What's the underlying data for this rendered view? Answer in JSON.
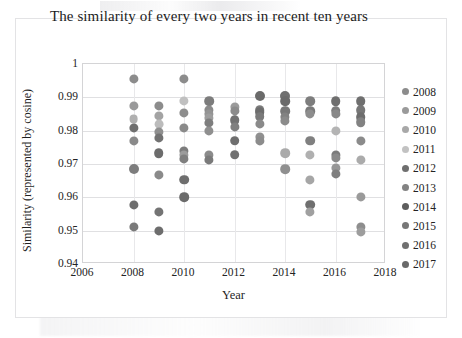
{
  "chart_data": {
    "type": "scatter",
    "title": "The similarity of every two years in recent ten years",
    "xlabel": "Year",
    "ylabel": "Similarity (represented by cosine)",
    "xlim": [
      2006,
      2018
    ],
    "ylim": [
      0.94,
      1
    ],
    "xticks": [
      "2006",
      "2008",
      "2010",
      "2012",
      "2014",
      "2016",
      "2018"
    ],
    "yticks": [
      "0.94",
      "0.95",
      "0.96",
      "0.97",
      "0.98",
      "0.99",
      "1"
    ],
    "grid": "horizontal-and-vertical",
    "legend_position": "right",
    "series": [
      {
        "name": "2008",
        "color": "#8c8c8c",
        "x": [
          2008,
          2009,
          2010,
          2011,
          2012,
          2013,
          2014,
          2015,
          2016,
          2017
        ],
        "values": [
          0.9955,
          0.9875,
          0.9955,
          0.9888,
          0.987,
          0.9903,
          0.9905,
          0.9888,
          0.9888,
          0.9888
        ]
      },
      {
        "name": "2009",
        "color": "#9a9a9a",
        "x": [
          2008,
          2009,
          2010,
          2011,
          2012,
          2013,
          2014,
          2015,
          2016,
          2017
        ],
        "values": [
          0.9875,
          0.9845,
          0.9888,
          0.986,
          0.9858,
          0.9862,
          0.9888,
          0.9858,
          0.9858,
          0.9862
        ]
      },
      {
        "name": "2010",
        "color": "#a8a8a8",
        "x": [
          2008,
          2009,
          2010,
          2011,
          2012,
          2013,
          2014,
          2015,
          2016,
          2017
        ],
        "values": [
          0.9835,
          0.982,
          0.9852,
          0.985,
          0.9832,
          0.9855,
          0.9858,
          0.985,
          0.985,
          0.9838
        ]
      },
      {
        "name": "2011",
        "color": "#c2c2c2",
        "x": [
          2008,
          2009,
          2010,
          2011,
          2012,
          2013,
          2014,
          2015,
          2016,
          2017
        ],
        "values": [
          0.9808,
          0.979,
          0.9808,
          0.9838,
          0.981,
          0.984,
          0.984,
          0.977,
          0.98,
          0.9825
        ]
      },
      {
        "name": "2012",
        "color": "#6f6f6f",
        "x": [
          2008,
          2009,
          2010,
          2011,
          2012,
          2013,
          2014,
          2015,
          2016,
          2017
        ],
        "values": [
          0.977,
          0.9775,
          0.9738,
          0.9825,
          0.977,
          0.982,
          0.9832,
          0.9728,
          0.9728,
          0.977
        ]
      },
      {
        "name": "2013",
        "color": "#838383",
        "x": [
          2008,
          2009,
          2010,
          2011,
          2012,
          2013,
          2014,
          2015,
          2016,
          2017
        ],
        "values": [
          0.9685,
          0.9732,
          0.9727,
          0.98,
          0.9728,
          0.9782,
          0.9733,
          0.9653,
          0.972,
          0.9712
        ]
      },
      {
        "name": "2014",
        "color": "#5e5e5e",
        "x": [
          2008,
          2009,
          2010,
          2011,
          2012,
          2013,
          2014,
          2015,
          2016,
          2017
        ],
        "values": [
          0.9578,
          0.9668,
          0.9718,
          0.9728,
          0.981,
          0.9768,
          0.9685,
          0.9578,
          0.9688,
          0.96
        ]
      },
      {
        "name": "2015",
        "color": "#777777",
        "x": [
          2008,
          2009,
          2010,
          2011,
          2012,
          2013,
          2014,
          2015,
          2016,
          2017
        ],
        "values": [
          0.9512,
          0.9555,
          0.9653,
          0.9712,
          0.9858,
          0.982,
          0.9858,
          0.9555,
          0.967,
          0.9512
        ]
      },
      {
        "name": "2016",
        "color": "#707070",
        "x": [
          2009,
          2010,
          2011,
          2012,
          2013,
          2014,
          2015,
          2016,
          2017
        ],
        "values": [
          0.9498,
          0.96,
          0.9728,
          0.9832,
          0.984,
          0.9832,
          0.985,
          0.9688,
          0.9495
        ]
      },
      {
        "name": "2017",
        "color": "#6a6a6a",
        "x": [
          2010,
          2011,
          2012,
          2013,
          2014,
          2015,
          2016,
          2017
        ],
        "values": [
          0.9727,
          0.985,
          0.9858,
          0.9855,
          0.9905,
          0.9888,
          0.9858,
          0.9825
        ]
      }
    ]
  },
  "legend": {
    "items": [
      {
        "label": "2008",
        "color": "#8c8c8c"
      },
      {
        "label": "2009",
        "color": "#9a9a9a"
      },
      {
        "label": "2010",
        "color": "#a8a8a8"
      },
      {
        "label": "2011",
        "color": "#c2c2c2"
      },
      {
        "label": "2012",
        "color": "#6f6f6f"
      },
      {
        "label": "2013",
        "color": "#838383"
      },
      {
        "label": "2014",
        "color": "#5e5e5e"
      },
      {
        "label": "2015",
        "color": "#777777"
      },
      {
        "label": "2016",
        "color": "#707070"
      },
      {
        "label": "2017",
        "color": "#6a6a6a"
      }
    ]
  },
  "points": [
    {
      "x": 2008,
      "y": 0.9955,
      "c": "#8c8c8c",
      "r": 4.6
    },
    {
      "x": 2008,
      "y": 0.9875,
      "c": "#9a9a9a",
      "r": 4.6
    },
    {
      "x": 2008,
      "y": 0.9835,
      "c": "#b0b0b0",
      "r": 4.4
    },
    {
      "x": 2008,
      "y": 0.9808,
      "c": "#6f6f6f",
      "r": 4.6
    },
    {
      "x": 2008,
      "y": 0.977,
      "c": "#8a8a8a",
      "r": 4.6
    },
    {
      "x": 2008,
      "y": 0.9685,
      "c": "#7d7d7d",
      "r": 5.0
    },
    {
      "x": 2008,
      "y": 0.9578,
      "c": "#6e6e6e",
      "r": 4.6
    },
    {
      "x": 2008,
      "y": 0.9512,
      "c": "#7a7a7a",
      "r": 4.6
    },
    {
      "x": 2009,
      "y": 0.9875,
      "c": "#8c8c8c",
      "r": 4.6
    },
    {
      "x": 2009,
      "y": 0.9845,
      "c": "#a3a3a3",
      "r": 4.6
    },
    {
      "x": 2009,
      "y": 0.982,
      "c": "#bcbcbc",
      "r": 4.4
    },
    {
      "x": 2009,
      "y": 0.9795,
      "c": "#8f8f8f",
      "r": 4.6
    },
    {
      "x": 2009,
      "y": 0.9778,
      "c": "#727272",
      "r": 4.6
    },
    {
      "x": 2009,
      "y": 0.9732,
      "c": "#6c6c6c",
      "r": 4.8
    },
    {
      "x": 2009,
      "y": 0.9668,
      "c": "#8a8a8a",
      "r": 4.6
    },
    {
      "x": 2009,
      "y": 0.9555,
      "c": "#747474",
      "r": 4.6
    },
    {
      "x": 2009,
      "y": 0.9498,
      "c": "#6d6d6d",
      "r": 4.6
    },
    {
      "x": 2010,
      "y": 0.9955,
      "c": "#8c8c8c",
      "r": 4.6
    },
    {
      "x": 2010,
      "y": 0.9888,
      "c": "#c0c0c0",
      "r": 4.6
    },
    {
      "x": 2010,
      "y": 0.9852,
      "c": "#8d8d8d",
      "r": 4.6
    },
    {
      "x": 2010,
      "y": 0.9808,
      "c": "#8a8a8a",
      "r": 4.6
    },
    {
      "x": 2010,
      "y": 0.974,
      "c": "#7c7c7c",
      "r": 4.6
    },
    {
      "x": 2010,
      "y": 0.9728,
      "c": "#9c9c9c",
      "r": 4.6
    },
    {
      "x": 2010,
      "y": 0.9716,
      "c": "#7f7f7f",
      "r": 4.6
    },
    {
      "x": 2010,
      "y": 0.9653,
      "c": "#6e6e6e",
      "r": 4.8
    },
    {
      "x": 2010,
      "y": 0.96,
      "c": "#6b6b6b",
      "r": 4.8
    },
    {
      "x": 2011,
      "y": 0.9888,
      "c": "#7c7c7c",
      "r": 4.8
    },
    {
      "x": 2011,
      "y": 0.9862,
      "c": "#8a8a8a",
      "r": 4.6
    },
    {
      "x": 2011,
      "y": 0.985,
      "c": "#949494",
      "r": 4.6
    },
    {
      "x": 2011,
      "y": 0.9838,
      "c": "#9d9d9d",
      "r": 4.6
    },
    {
      "x": 2011,
      "y": 0.9824,
      "c": "#7e7e7e",
      "r": 4.6
    },
    {
      "x": 2011,
      "y": 0.98,
      "c": "#8f8f8f",
      "r": 4.6
    },
    {
      "x": 2011,
      "y": 0.9728,
      "c": "#8b8b8b",
      "r": 4.6
    },
    {
      "x": 2011,
      "y": 0.9712,
      "c": "#7a7a7a",
      "r": 4.6
    },
    {
      "x": 2012,
      "y": 0.987,
      "c": "#9b9b9b",
      "r": 4.6
    },
    {
      "x": 2012,
      "y": 0.9858,
      "c": "#8b8b8b",
      "r": 4.6
    },
    {
      "x": 2012,
      "y": 0.9832,
      "c": "#717171",
      "r": 4.8
    },
    {
      "x": 2012,
      "y": 0.981,
      "c": "#7f7f7f",
      "r": 4.6
    },
    {
      "x": 2012,
      "y": 0.977,
      "c": "#6e6e6e",
      "r": 4.8
    },
    {
      "x": 2012,
      "y": 0.9728,
      "c": "#717171",
      "r": 4.8
    },
    {
      "x": 2013,
      "y": 0.9903,
      "c": "#6a6a6a",
      "r": 5.0
    },
    {
      "x": 2013,
      "y": 0.9862,
      "c": "#7b7b7b",
      "r": 4.8
    },
    {
      "x": 2013,
      "y": 0.9855,
      "c": "#6d6d6d",
      "r": 4.8
    },
    {
      "x": 2013,
      "y": 0.9842,
      "c": "#7a7a7a",
      "r": 4.8
    },
    {
      "x": 2013,
      "y": 0.982,
      "c": "#8a8a8a",
      "r": 4.6
    },
    {
      "x": 2013,
      "y": 0.9782,
      "c": "#909090",
      "r": 4.6
    },
    {
      "x": 2013,
      "y": 0.9768,
      "c": "#8c8c8c",
      "r": 4.6
    },
    {
      "x": 2014,
      "y": 0.9905,
      "c": "#6f6f6f",
      "r": 5.0
    },
    {
      "x": 2014,
      "y": 0.9888,
      "c": "#6a6a6a",
      "r": 4.8
    },
    {
      "x": 2014,
      "y": 0.9858,
      "c": "#787878",
      "r": 4.8
    },
    {
      "x": 2014,
      "y": 0.9842,
      "c": "#828282",
      "r": 4.6
    },
    {
      "x": 2014,
      "y": 0.983,
      "c": "#8b8b8b",
      "r": 4.6
    },
    {
      "x": 2014,
      "y": 0.9733,
      "c": "#aaaaaa",
      "r": 4.8
    },
    {
      "x": 2014,
      "y": 0.9685,
      "c": "#8f8f8f",
      "r": 4.8
    },
    {
      "x": 2015,
      "y": 0.9888,
      "c": "#7d7d7d",
      "r": 4.8
    },
    {
      "x": 2015,
      "y": 0.9858,
      "c": "#7a7a7a",
      "r": 4.8
    },
    {
      "x": 2015,
      "y": 0.985,
      "c": "#8d8d8d",
      "r": 4.6
    },
    {
      "x": 2015,
      "y": 0.977,
      "c": "#808080",
      "r": 4.8
    },
    {
      "x": 2015,
      "y": 0.9728,
      "c": "#b0b0b0",
      "r": 4.6
    },
    {
      "x": 2015,
      "y": 0.9653,
      "c": "#a6a6a6",
      "r": 4.6
    },
    {
      "x": 2015,
      "y": 0.9578,
      "c": "#6f6f6f",
      "r": 4.8
    },
    {
      "x": 2015,
      "y": 0.9555,
      "c": "#a0a0a0",
      "r": 4.6
    },
    {
      "x": 2016,
      "y": 0.9888,
      "c": "#6e6e6e",
      "r": 4.8
    },
    {
      "x": 2016,
      "y": 0.986,
      "c": "#7c7c7c",
      "r": 4.8
    },
    {
      "x": 2016,
      "y": 0.985,
      "c": "#888888",
      "r": 4.6
    },
    {
      "x": 2016,
      "y": 0.98,
      "c": "#b4b4b4",
      "r": 4.6
    },
    {
      "x": 2016,
      "y": 0.9728,
      "c": "#7b7b7b",
      "r": 4.6
    },
    {
      "x": 2016,
      "y": 0.9718,
      "c": "#8a8a8a",
      "r": 4.6
    },
    {
      "x": 2016,
      "y": 0.9688,
      "c": "#979797",
      "r": 4.6
    },
    {
      "x": 2016,
      "y": 0.967,
      "c": "#7f7f7f",
      "r": 4.6
    },
    {
      "x": 2017,
      "y": 0.9888,
      "c": "#6f6f6f",
      "r": 4.8
    },
    {
      "x": 2017,
      "y": 0.9862,
      "c": "#777777",
      "r": 4.8
    },
    {
      "x": 2017,
      "y": 0.984,
      "c": "#6d6d6d",
      "r": 4.8
    },
    {
      "x": 2017,
      "y": 0.9826,
      "c": "#828282",
      "r": 4.8
    },
    {
      "x": 2017,
      "y": 0.977,
      "c": "#8b8b8b",
      "r": 4.6
    },
    {
      "x": 2017,
      "y": 0.9712,
      "c": "#ababab",
      "r": 4.6
    },
    {
      "x": 2017,
      "y": 0.96,
      "c": "#9a9a9a",
      "r": 4.6
    },
    {
      "x": 2017,
      "y": 0.9512,
      "c": "#8e8e8e",
      "r": 4.6
    },
    {
      "x": 2017,
      "y": 0.9495,
      "c": "#9d9d9d",
      "r": 4.6
    }
  ]
}
